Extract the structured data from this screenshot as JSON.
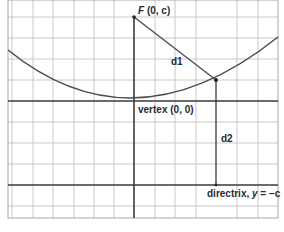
{
  "diagram": {
    "type": "parabola-focus-directrix",
    "labels": {
      "focus_name": "F",
      "focus_coords": "(0, c)",
      "vertex": "vertex (0, 0)",
      "d1": "d1",
      "d2": "d2",
      "directrix_prefix": "directrix, ",
      "directrix_eq_var": "y",
      "directrix_eq_rest": " = −c"
    },
    "colors": {
      "grid": "#c8c8c8",
      "axis": "#3a3a3a",
      "curve": "#4a4a4a",
      "text": "#2a2a2a"
    },
    "grid": {
      "vertical_lines_x": [
        12,
        33,
        53,
        74,
        94,
        114,
        155,
        175,
        196,
        216,
        237,
        258
      ],
      "horizontal_lines_y": [
        17,
        38,
        59,
        80,
        122,
        143,
        164,
        206
      ]
    },
    "points": {
      "focus": [
        134,
        17
      ],
      "vertex": [
        134,
        101
      ],
      "on_parabola": [
        216,
        80
      ]
    }
  }
}
